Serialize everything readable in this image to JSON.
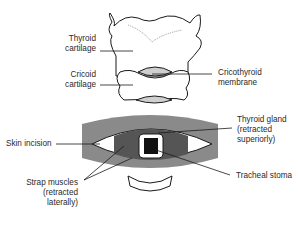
{
  "labels": {
    "thyroid_cartilage": [
      "Thyroid",
      "cartilage"
    ],
    "cricoid_cartilage": [
      "Cricoid",
      "cartilage"
    ],
    "cricothyroid_membrane": [
      "Cricothyroid",
      "membrane"
    ],
    "skin_incision": "Skin incision",
    "thyroid_gland": [
      "Thyroid gland",
      "(retracted",
      "superiorly)"
    ],
    "strap_muscles": [
      "Strap muscles",
      "(retracted",
      "laterally)"
    ],
    "tracheal_stoma": "Tracheal stoma"
  },
  "colors": {
    "outline": "#1a1a1a",
    "skin": "#8a8a8a",
    "muscle": "#555555",
    "membrane": "#cfcfcf",
    "stoma": "#111111",
    "cartilage": "#ffffff"
  }
}
